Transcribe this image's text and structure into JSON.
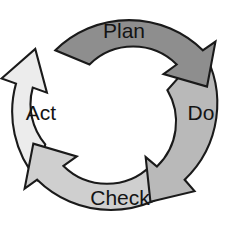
{
  "diagram": {
    "type": "cycle-diagram",
    "direction": "clockwise",
    "background_color": "#ffffff",
    "outline_color": "#1a1a1a",
    "center": {
      "x": 120,
      "y": 115
    },
    "outer_radius": 105,
    "inner_radius": 62,
    "segments": [
      {
        "id": "plan",
        "label": "Plan",
        "fill_color": "#8e8e8e",
        "order": 1,
        "label_x": 124,
        "label_y": 32,
        "start_angle": -128,
        "end_angle": -38,
        "arrow_name": "plan-arrow"
      },
      {
        "id": "do",
        "label": "Do",
        "fill_color": "#b9b9b9",
        "order": 2,
        "label_x": 201,
        "label_y": 114,
        "start_angle": -38,
        "end_angle": 52,
        "arrow_name": "do-arrow"
      },
      {
        "id": "check",
        "label": "Check",
        "fill_color": "#cfcfcf",
        "order": 3,
        "label_x": 120,
        "label_y": 199,
        "start_angle": 52,
        "end_angle": 142,
        "arrow_name": "check-arrow"
      },
      {
        "id": "act",
        "label": "Act",
        "fill_color": "#ececec",
        "order": 4,
        "label_x": 41,
        "label_y": 114,
        "start_angle": 142,
        "end_angle": 232,
        "arrow_name": "act-arrow"
      }
    ]
  }
}
